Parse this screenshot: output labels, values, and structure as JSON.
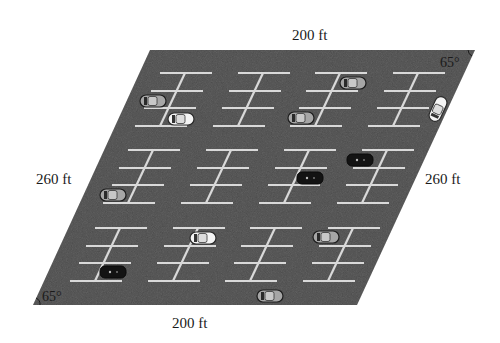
{
  "diagram": {
    "colors": {
      "asphalt": "#4a4a4a",
      "line": "#d9d9d9",
      "car_white": "#f2f2f2",
      "car_gray": "#9a9a9a",
      "car_black": "#151515",
      "text": "#1a1a1a"
    },
    "lot": {
      "corners": {
        "top_left": [
          150,
          50
        ],
        "top_right": [
          475,
          50
        ],
        "bottom_right": [
          357,
          305
        ],
        "bottom_left": [
          33,
          305
        ]
      }
    },
    "labels": {
      "top_side": "200 ft",
      "bottom_side": "200 ft",
      "left_side": "260 ft",
      "right_side": "260 ft",
      "top_right_angle": "65°",
      "bottom_left_angle": "65°"
    },
    "parking_blocks": [
      {
        "row": 1,
        "col": 1,
        "x": 160,
        "y": 73
      },
      {
        "row": 1,
        "col": 2,
        "x": 238,
        "y": 73
      },
      {
        "row": 1,
        "col": 3,
        "x": 315,
        "y": 73
      },
      {
        "row": 1,
        "col": 4,
        "x": 393,
        "y": 73
      },
      {
        "row": 2,
        "col": 1,
        "x": 128,
        "y": 150
      },
      {
        "row": 2,
        "col": 2,
        "x": 206,
        "y": 150
      },
      {
        "row": 2,
        "col": 3,
        "x": 284,
        "y": 150
      },
      {
        "row": 2,
        "col": 4,
        "x": 362,
        "y": 150
      },
      {
        "row": 3,
        "col": 1,
        "x": 95,
        "y": 228
      },
      {
        "row": 3,
        "col": 2,
        "x": 173,
        "y": 228
      },
      {
        "row": 3,
        "col": 3,
        "x": 250,
        "y": 228
      },
      {
        "row": 3,
        "col": 4,
        "x": 328,
        "y": 228
      }
    ],
    "cars": [
      {
        "id": "car-1",
        "x": 153,
        "y": 101,
        "rot": 0,
        "color": "gray"
      },
      {
        "id": "car-2",
        "x": 181,
        "y": 119,
        "rot": 0,
        "color": "white"
      },
      {
        "id": "car-3",
        "x": 353,
        "y": 83,
        "rot": 0,
        "color": "gray"
      },
      {
        "id": "car-4",
        "x": 301,
        "y": 118,
        "rot": 0,
        "color": "gray"
      },
      {
        "id": "car-5",
        "x": 438,
        "y": 109,
        "rot": -65,
        "color": "white"
      },
      {
        "id": "car-6",
        "x": 360,
        "y": 160,
        "rot": 0,
        "color": "black"
      },
      {
        "id": "car-7",
        "x": 310,
        "y": 178,
        "rot": 0,
        "color": "black"
      },
      {
        "id": "car-8",
        "x": 113,
        "y": 195,
        "rot": 0,
        "color": "gray"
      },
      {
        "id": "car-9",
        "x": 203,
        "y": 238,
        "rot": 0,
        "color": "white"
      },
      {
        "id": "car-10",
        "x": 326,
        "y": 237,
        "rot": 0,
        "color": "gray"
      },
      {
        "id": "car-11",
        "x": 113,
        "y": 272,
        "rot": 0,
        "color": "black"
      },
      {
        "id": "car-12",
        "x": 270,
        "y": 296,
        "rot": 0,
        "color": "gray"
      }
    ]
  }
}
